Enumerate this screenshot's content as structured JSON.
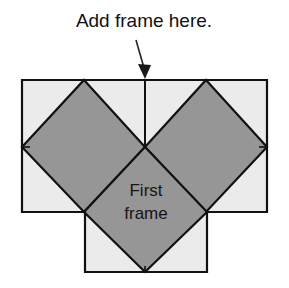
{
  "figure": {
    "title": "Add frame here.",
    "annotation": {
      "label": "Add frame here.",
      "arrow_name": "down-arrow"
    },
    "center_patch": {
      "line1": "First",
      "line2": "frame"
    },
    "colors": {
      "background": "#ffffff",
      "light_fabric": "#ebebeb",
      "dark_fabric": "#969696",
      "outline": "#111111",
      "text": "#111111"
    },
    "shapes": {
      "outline_points": "22,80 267,80 267,212 207,212 207,272 85,272 85,212 22,212",
      "light_regions": [
        "22,80 145,80 145,147 83,147 22,147",
        "145,80 267,80 267,147 207,147 145,147",
        "22,147 83,147 145,212 85,212 22,212",
        "207,147 267,147 267,212 207,212",
        "85,212 145,272 85,272",
        "207,212 207,272 145,272"
      ],
      "dark_diamonds": [
        "84,80 145,147 84,212 22,147",
        "206,80 267,147 206,212 145,147",
        "145,147 207,212 145,272 84,212"
      ],
      "vertical_seam_top": "145,80 145,147",
      "vertical_seam_bottom": "145,272 145,268"
    },
    "arrow": {
      "shaft_start_x": 136,
      "shaft_start_y": 40,
      "shaft_end_x": 145,
      "shaft_end_y": 70,
      "head_points": "145,79 139,66 151,66"
    }
  }
}
